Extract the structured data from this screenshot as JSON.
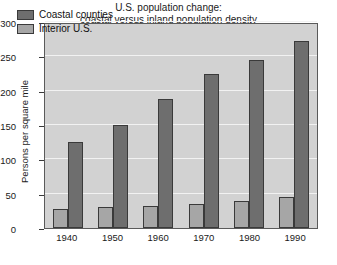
{
  "chart_data": {
    "type": "bar",
    "title": "U.S. population change:\ncoastal versus inland population density",
    "title_line1": "U.S. population change:",
    "title_line2": "coastal versus inland population density",
    "xlabel": "",
    "ylabel": "Persons per square mile",
    "categories": [
      "1940",
      "1950",
      "1960",
      "1970",
      "1980",
      "1990"
    ],
    "series": [
      {
        "name": "Interior U.S.",
        "color": "#a6a6a6",
        "values": [
          27,
          30,
          32,
          35,
          39,
          45
        ]
      },
      {
        "name": "Coastal counties",
        "color": "#6e6e6e",
        "values": [
          125,
          150,
          188,
          224,
          245,
          272
        ]
      }
    ],
    "legend_order": [
      "Coastal counties",
      "Interior U.S."
    ],
    "legend_position": "top-left-inside",
    "ylim": [
      0,
      300
    ],
    "yticks": [
      "0",
      "50",
      "100",
      "150",
      "200",
      "250",
      "300"
    ],
    "ytick_values": [
      0,
      50,
      100,
      150,
      200,
      250,
      300
    ],
    "grid": true,
    "grid_color": "#f2f2f2",
    "plot_background": "#d2d2d2",
    "bar_order_in_group": [
      "Interior U.S.",
      "Coastal counties"
    ]
  }
}
